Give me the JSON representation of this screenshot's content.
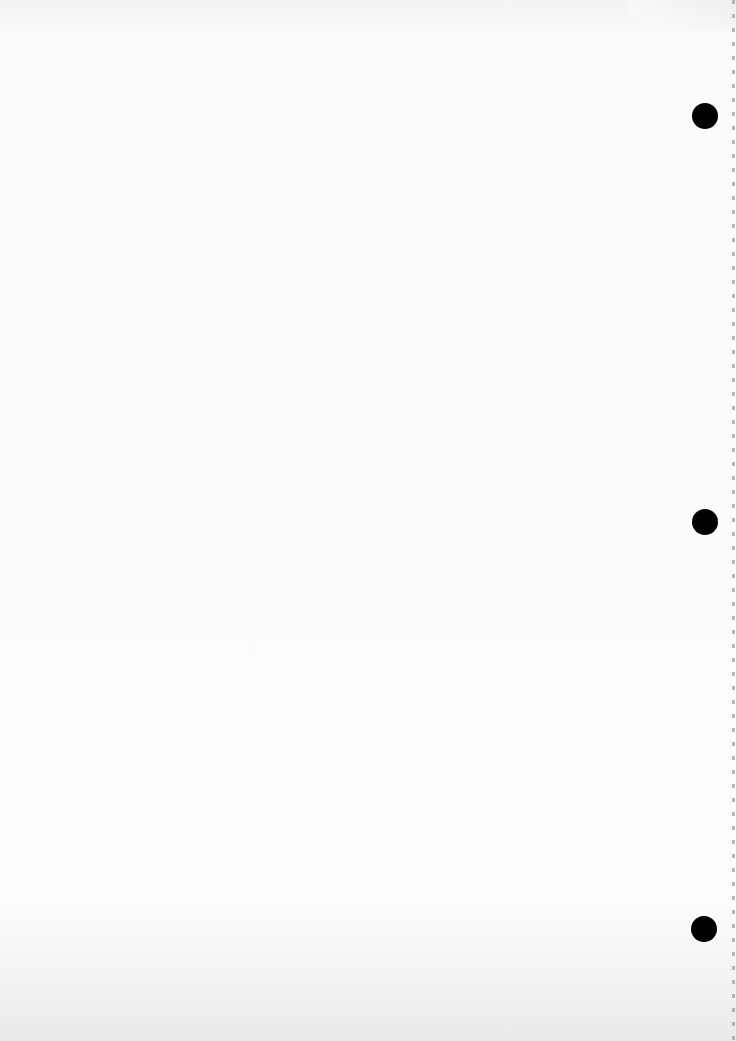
{
  "page": {
    "type": "blank scanned sheet",
    "background_color": "#fbfbfb",
    "punch_holes": [
      {
        "x": 705,
        "y": 116
      },
      {
        "x": 705,
        "y": 522
      },
      {
        "x": 704,
        "y": 929
      }
    ],
    "hole_color": "#000000",
    "bleed_through_text": ""
  }
}
